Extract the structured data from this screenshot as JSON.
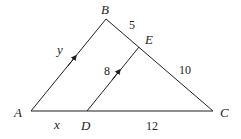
{
  "diagram": {
    "vertices": {
      "A": {
        "label": "A",
        "x": 31,
        "y": 111
      },
      "B": {
        "label": "B",
        "x": 106,
        "y": 19
      },
      "C": {
        "label": "C",
        "x": 213,
        "y": 111
      },
      "D": {
        "label": "D",
        "x": 87,
        "y": 111
      },
      "E": {
        "label": "E",
        "x": 139,
        "y": 47
      }
    },
    "segments": {
      "AD": "x",
      "DC": "12",
      "AB": "y",
      "BE": "5",
      "EC": "10",
      "DE": "8"
    },
    "parallel_marks": [
      "AB",
      "DE"
    ],
    "stroke_color": "#231f20"
  }
}
